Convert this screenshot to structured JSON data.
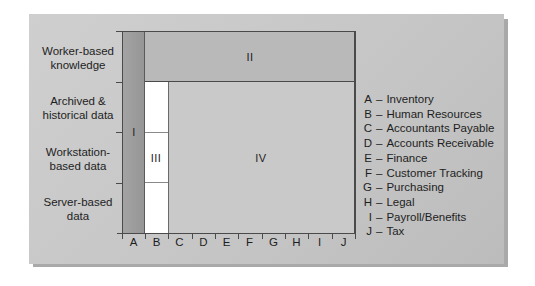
{
  "diagram": {
    "row_labels": [
      {
        "line1": "Worker-based",
        "line2": "knowledge"
      },
      {
        "line1": "Archived &",
        "line2": "historical data"
      },
      {
        "line1": "Workstation-",
        "line2": "based data"
      },
      {
        "line1": "Server-based",
        "line2": "data"
      }
    ],
    "columns": [
      "A",
      "B",
      "C",
      "D",
      "E",
      "F",
      "G",
      "H",
      "I",
      "J"
    ],
    "regions": {
      "I": "I",
      "II": "II",
      "III": "III",
      "IV": "IV"
    },
    "legend": [
      {
        "key": "A",
        "sep": "–",
        "value": "Inventory"
      },
      {
        "key": "B",
        "sep": "–",
        "value": "Human Resources"
      },
      {
        "key": "C",
        "sep": "–",
        "value": "Accountants Payable"
      },
      {
        "key": "D",
        "sep": "–",
        "value": "Accounts Receivable"
      },
      {
        "key": "E",
        "sep": "–",
        "value": "Finance"
      },
      {
        "key": "F",
        "sep": "–",
        "value": "Customer Tracking"
      },
      {
        "key": "G",
        "sep": "–",
        "value": "Purchasing"
      },
      {
        "key": "H",
        "sep": "–",
        "value": "Legal"
      },
      {
        "key": "I",
        "sep": "–",
        "value": "Payroll/Benefits"
      },
      {
        "key": "J",
        "sep": "–",
        "value": "Tax"
      }
    ],
    "colors": {
      "panel": "#c8c8c8",
      "region_I": "#9c9c9c",
      "region_II": "#b9b9b9",
      "region_III": "#ffffff",
      "region_IV": "#c9c9c9",
      "lines": "#4a4a4a"
    }
  }
}
